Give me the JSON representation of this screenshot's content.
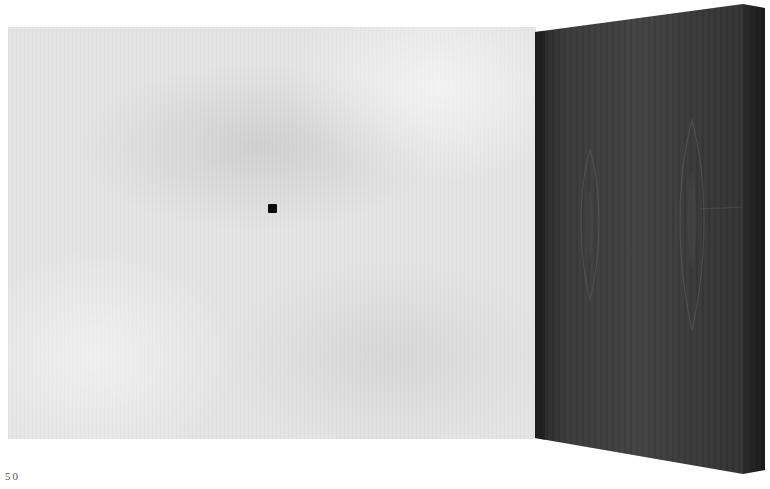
{
  "page": {
    "page_number": "50"
  },
  "figure": {
    "left_panel": {
      "description": "light gray mottled panel",
      "color": "#e4e4e4"
    },
    "marker": {
      "description": "small black square",
      "color": "#0c0c0c"
    },
    "right_panel": {
      "description": "dark wood-grain slab in perspective",
      "front_color": "#3a3a3a",
      "side_color": "#1e1e1e"
    }
  }
}
